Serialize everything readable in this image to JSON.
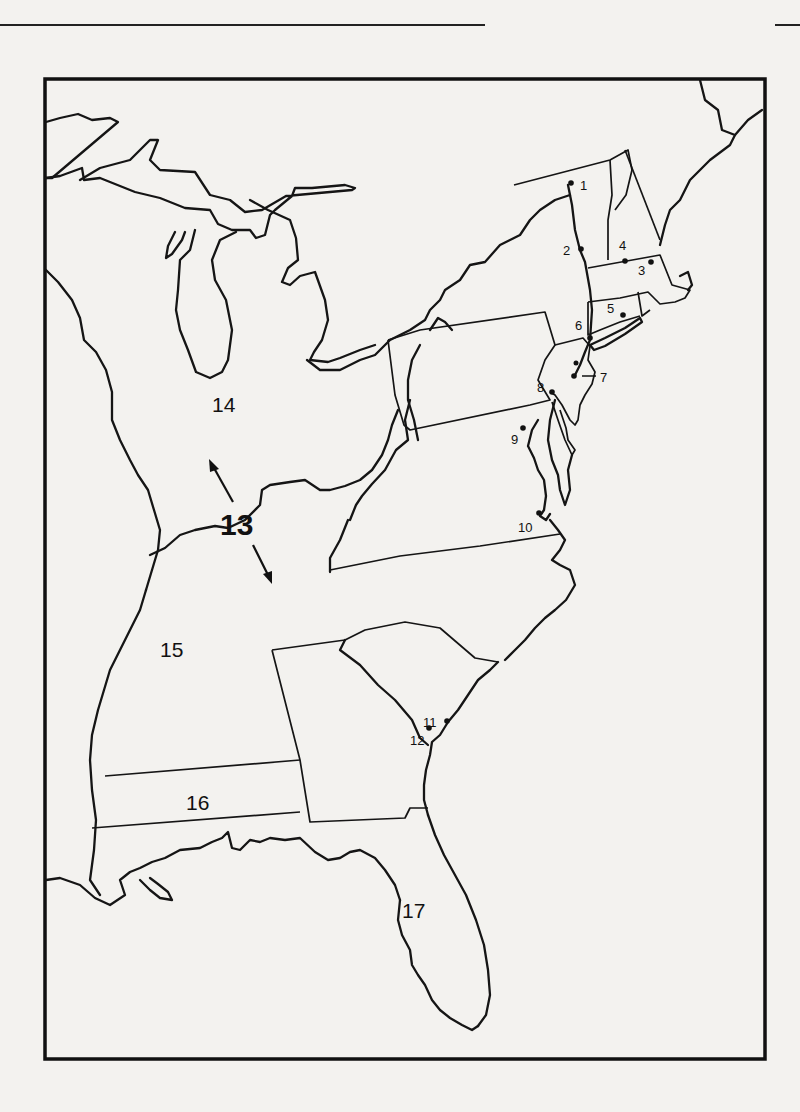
{
  "map": {
    "title": "",
    "description": "Outline map of the eastern United States with numbered locations",
    "colors": {
      "ink": "#111111",
      "paper": "#f3f2ef"
    },
    "point_labels": [
      {
        "id": "1",
        "text": "1",
        "x": 580,
        "y": 190,
        "dot": [
          571,
          183
        ]
      },
      {
        "id": "2",
        "text": "2",
        "x": 563,
        "y": 255,
        "dot": [
          581,
          249
        ]
      },
      {
        "id": "3",
        "text": "3",
        "x": 638,
        "y": 275,
        "dot": [
          651,
          262
        ]
      },
      {
        "id": "4",
        "text": "4",
        "x": 619,
        "y": 250,
        "dot": [
          625,
          261
        ]
      },
      {
        "id": "5",
        "text": "5",
        "x": 607,
        "y": 313,
        "dot": [
          623,
          315
        ]
      },
      {
        "id": "6",
        "text": "6",
        "x": 575,
        "y": 330,
        "dot": [
          590,
          338
        ]
      },
      {
        "id": "7",
        "text": "7",
        "x": 600,
        "y": 382,
        "dot": [
          576,
          376
        ]
      },
      {
        "id": "8",
        "text": "8",
        "x": 537,
        "y": 392,
        "dot": [
          552,
          392
        ]
      },
      {
        "id": "9",
        "text": "9",
        "x": 511,
        "y": 444,
        "dot": [
          523,
          428
        ]
      },
      {
        "id": "10",
        "text": "10",
        "x": 518,
        "y": 532,
        "dot": [
          539,
          513
        ]
      },
      {
        "id": "11",
        "text": "11",
        "x": 423,
        "y": 727,
        "dot": [
          447,
          721
        ]
      },
      {
        "id": "12",
        "text": "12",
        "x": 410,
        "y": 745,
        "dot": [
          429,
          728
        ]
      }
    ],
    "region_labels": [
      {
        "id": "13",
        "text": "13",
        "x": 220,
        "y": 535
      },
      {
        "id": "14",
        "text": "14",
        "x": 212,
        "y": 412
      },
      {
        "id": "15",
        "text": "15",
        "x": 160,
        "y": 657
      },
      {
        "id": "16",
        "text": "16",
        "x": 186,
        "y": 810
      },
      {
        "id": "17",
        "text": "17",
        "x": 402,
        "y": 918
      }
    ],
    "arrows": [
      {
        "from": "13",
        "direction": "northwest"
      },
      {
        "from": "13",
        "direction": "southeast"
      }
    ]
  }
}
